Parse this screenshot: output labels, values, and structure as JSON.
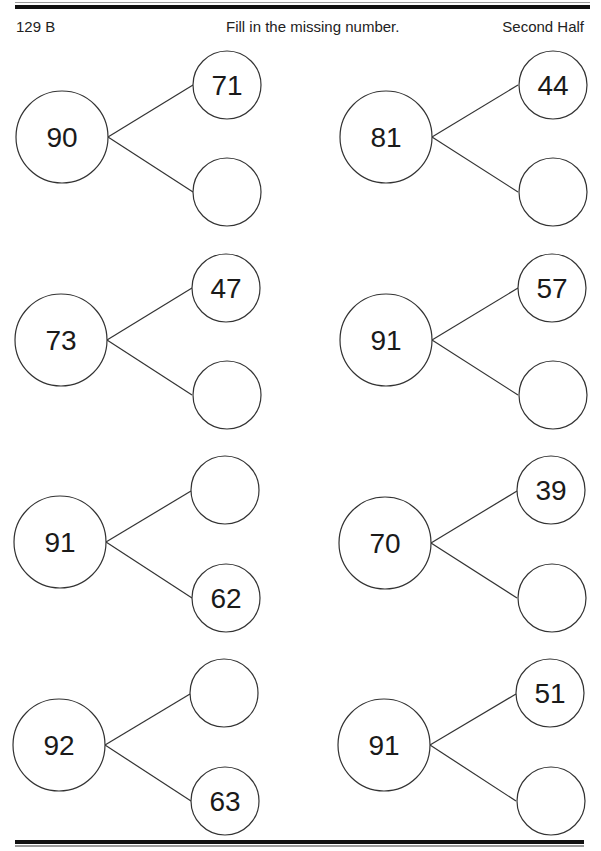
{
  "header": {
    "left": "129 B",
    "center": "Fill in the missing number.",
    "right": "Second Half"
  },
  "problems": [
    {
      "whole": "90",
      "top": "71",
      "bottom": ""
    },
    {
      "whole": "81",
      "top": "44",
      "bottom": ""
    },
    {
      "whole": "73",
      "top": "47",
      "bottom": ""
    },
    {
      "whole": "91",
      "top": "57",
      "bottom": ""
    },
    {
      "whole": "91",
      "top": "",
      "bottom": "62"
    },
    {
      "whole": "70",
      "top": "39",
      "bottom": ""
    },
    {
      "whole": "92",
      "top": "",
      "bottom": "63"
    },
    {
      "whole": "91",
      "top": "51",
      "bottom": ""
    }
  ]
}
